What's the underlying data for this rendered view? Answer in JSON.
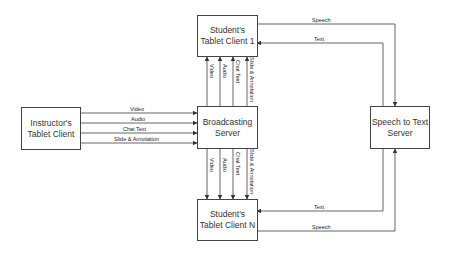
{
  "nodes": {
    "instructor": {
      "label": "Instructor's\nTablet Client"
    },
    "broadcast": {
      "label": "Broadcasting\nServer"
    },
    "student1": {
      "label": "Student's\nTablet Client 1"
    },
    "studentN": {
      "label": "Student's\nTablet Client N"
    },
    "stt": {
      "label": "Speech to Text\nServer"
    }
  },
  "edges": {
    "instructor_broadcast": [
      "Video",
      "Audio",
      "Chat Text",
      "Slide & Annotation"
    ],
    "broadcast_student1": [
      "Video",
      "Audio",
      "Chat Text",
      "Slide & Annotation"
    ],
    "broadcast_studentN": [
      "Video",
      "Audio",
      "Chat Text",
      "Slide & Annotation"
    ],
    "student1_stt": {
      "speech": "Speech",
      "text": "Text"
    },
    "studentN_stt": {
      "speech": "Speech",
      "text": "Text"
    }
  }
}
